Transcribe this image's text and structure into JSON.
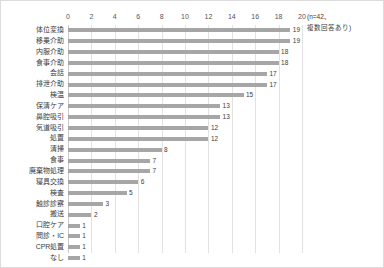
{
  "chart_data": {
    "type": "bar",
    "orientation": "horizontal",
    "title": "",
    "subtitle": "",
    "xlabel": "",
    "ylabel": "",
    "xlim": [
      0,
      20
    ],
    "xticks": [
      0,
      2,
      4,
      6,
      8,
      10,
      12,
      14,
      16,
      18,
      20
    ],
    "grid": true,
    "legend": false,
    "bar_color": "#a6a6a6",
    "annotation_lines": [
      "(n=42、",
      "複数回答あり)"
    ],
    "categories": [
      "体位変換",
      "移乗介助",
      "内服介助",
      "食事介助",
      "会話",
      "排泄介助",
      "検温",
      "保清ケア",
      "鼻腔吸引",
      "気道吸引",
      "処置",
      "清掃",
      "食事",
      "廃棄物処理",
      "寝具交換",
      "検査",
      "触診診察",
      "搬送",
      "口腔ケア",
      "問診・IC",
      "CPR処置",
      "なし"
    ],
    "values": [
      19,
      19,
      18,
      18,
      17,
      17,
      15,
      13,
      13,
      12,
      12,
      8,
      7,
      7,
      6,
      5,
      3,
      2,
      1,
      1,
      1,
      1
    ],
    "data_labels": [
      "19",
      "19",
      "18",
      "18",
      "17",
      "17",
      "15",
      "13",
      "13",
      "12",
      "12",
      "8",
      "7",
      "7",
      "6",
      "5",
      "3",
      "2",
      "1",
      "1",
      "1",
      "1"
    ]
  }
}
